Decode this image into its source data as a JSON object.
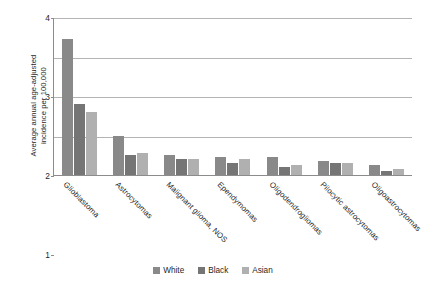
{
  "chart_data": {
    "type": "bar",
    "title": "",
    "xlabel": "",
    "ylabel": "Average annual age-adjusted\nincidence per 100,000",
    "ylim": [
      0,
      4
    ],
    "yticks": [
      0,
      1,
      2,
      3,
      4
    ],
    "ytick_labels": [
      "0",
      "1",
      "2",
      "3",
      "4"
    ],
    "grid": "horizontal",
    "legend_position": "bottom-center",
    "categories": [
      "Glioblastoma",
      "Astrocytomas",
      "Malignant glioma, NOS",
      "Ependymomas",
      "Oligodendrogliomas",
      "Pilocytic astrocytomas",
      "Oligoastrocytomas"
    ],
    "series": [
      {
        "name": "White",
        "color": "#898989",
        "values": [
          3.45,
          1.0,
          0.5,
          0.45,
          0.45,
          0.35,
          0.25
        ]
      },
      {
        "name": "Black",
        "color": "#757575",
        "values": [
          1.8,
          0.5,
          0.4,
          0.3,
          0.2,
          0.3,
          0.1
        ]
      },
      {
        "name": "Asian",
        "color": "#b0b0b0",
        "values": [
          1.6,
          0.55,
          0.4,
          0.4,
          0.25,
          0.3,
          0.15
        ]
      }
    ]
  }
}
